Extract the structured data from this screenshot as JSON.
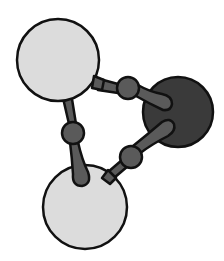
{
  "diagram": {
    "type": "molecule-ball-and-stick",
    "description": "Three-atom ring molecule: two large light-grey atoms and one dark-grey atom joined by bonds with bead connectors",
    "colors": {
      "outline": "#111111",
      "light_atom": "#dcdcdc",
      "dark_atom": "#3a3a3a",
      "bond": "#5a5a5a",
      "background": "#ffffff"
    },
    "atoms": [
      {
        "id": "atom-top-left",
        "kind": "light",
        "cx": 58,
        "cy": 60,
        "r": 41
      },
      {
        "id": "atom-right",
        "kind": "dark",
        "cx": 178,
        "cy": 112,
        "r": 35
      },
      {
        "id": "atom-bottom",
        "kind": "light",
        "cx": 85,
        "cy": 207,
        "r": 42
      }
    ],
    "bonds": [
      {
        "id": "bond-top",
        "from": "atom-top-left",
        "to": "atom-right",
        "bead": {
          "cx": 128,
          "cy": 88,
          "r": 11
        }
      },
      {
        "id": "bond-left",
        "from": "atom-top-left",
        "to": "atom-bottom",
        "bead": {
          "cx": 73,
          "cy": 133,
          "r": 11
        }
      },
      {
        "id": "bond-bottom",
        "from": "atom-bottom",
        "to": "atom-right",
        "bead": {
          "cx": 131,
          "cy": 157,
          "r": 11
        }
      }
    ]
  }
}
